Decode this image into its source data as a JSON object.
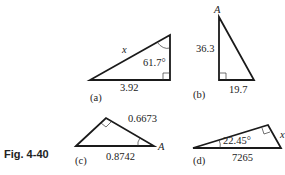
{
  "figure": {
    "caption": "Fig. 4-40",
    "panels": [
      {
        "id": "a",
        "label": "(a)",
        "hypotenuse": "x",
        "angle": "61.7°",
        "base": "3.92"
      },
      {
        "id": "b",
        "label": "(b)",
        "vertex": "A",
        "height": "36.3",
        "base": "19.7"
      },
      {
        "id": "c",
        "label": "(c)",
        "side": "0.6673",
        "base": "0.8742",
        "vertex": "A"
      },
      {
        "id": "d",
        "label": "(d)",
        "angle": "22.45°",
        "side": "x",
        "base": "7265"
      }
    ]
  }
}
